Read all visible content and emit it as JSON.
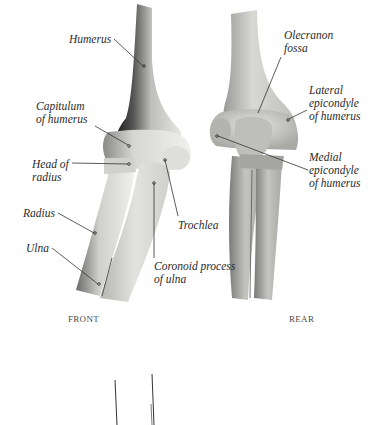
{
  "diagram": {
    "views": [
      {
        "id": "front",
        "caption": "FRONT"
      },
      {
        "id": "rear",
        "caption": "REAR"
      }
    ],
    "front_labels": {
      "humerus": "Humerus",
      "capitulum_line1": "Capitulum",
      "capitulum_line2": "of humerus",
      "head_radius_line1": "Head of",
      "head_radius_line2": "radius",
      "radius": "Radius",
      "ulna": "Ulna",
      "trochlea": "Trochlea",
      "coronoid_line1": "Coronoid process",
      "coronoid_line2": "of ulna"
    },
    "rear_labels": {
      "olecranon_line1": "Olecranon",
      "olecranon_line2": "fossa",
      "lateral_line1": "Lateral",
      "lateral_line2": "epicondyle",
      "lateral_line3": "of humerus",
      "medial_line1": "Medial",
      "medial_line2": "epicondyle",
      "medial_line3": "of humerus"
    },
    "colors": {
      "background": "#ffffff",
      "bone_light": "#ececea",
      "bone_mid": "#c9c9c6",
      "bone_dark": "#6e6e6c",
      "label_text": "#2a2a2a",
      "leader_line": "#333333"
    }
  }
}
